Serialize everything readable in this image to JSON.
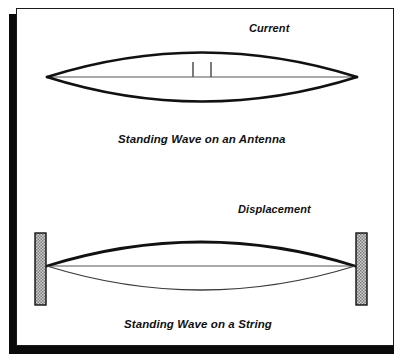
{
  "figure": {
    "background_color": "#ffffff",
    "ink_color": "#111111",
    "axis_color": "#8c8c8c",
    "wall_fill_color": "#b5b5b5",
    "frame_shadow_color": "#0a0a0a"
  },
  "panels": [
    {
      "id": "antenna",
      "caption": "Standing Wave on an Antenna",
      "quantity_label": "Current",
      "endpoints": {
        "left_x": 47,
        "right_x": 357,
        "axis_y": 77
      },
      "envelope": {
        "peak_y": 40,
        "trough_y": 114
      },
      "feed_gap": {
        "left_stub_x": 193,
        "right_stub_x": 211,
        "stub_top_y": 62,
        "stub_bottom_y": 77
      }
    },
    {
      "id": "string",
      "caption": "Standing Wave on a String",
      "quantity_label": "Displacement",
      "endpoints": {
        "left_x": 47,
        "right_x": 355,
        "axis_y": 266
      },
      "envelope": {
        "peak_y": 228,
        "trough_y": 303
      },
      "walls": [
        {
          "side": "left",
          "x": 35,
          "y": 233,
          "width": 11,
          "height": 72
        },
        {
          "side": "right",
          "x": 356,
          "y": 233,
          "width": 11,
          "height": 72
        }
      ]
    }
  ],
  "labels": {
    "current": "Current",
    "antenna_caption": "Standing Wave on an Antenna",
    "displacement": "Displacement",
    "string_caption": "Standing Wave on a String"
  }
}
